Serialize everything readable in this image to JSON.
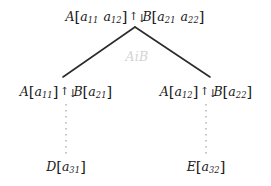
{
  "diagram": {
    "background_color": "#ffffff",
    "text_color": "#1a1a1a",
    "edge_color": "#2b2b2b",
    "dotted_color": "#b4b4b4",
    "edge_label_color": "#d3d3d3",
    "arrow_glyph_up": "↑",
    "arrow_glyph_down": "↓",
    "bracket_open": "[",
    "bracket_close": "]"
  },
  "nodes": {
    "root": {
      "left_symbol": "A",
      "left_entries": [
        "a",
        "a"
      ],
      "left_subscripts": [
        "11",
        "12"
      ],
      "relation": "↑↓",
      "right_symbol": "B",
      "right_entries": [
        "a",
        "a"
      ],
      "right_subscripts": [
        "21",
        "22"
      ],
      "plain_text": "A[a11 a12] ↑↓ B[a21 a22]"
    },
    "child_left": {
      "left_symbol": "A",
      "left_subscript": "11",
      "left_entry": "a",
      "relation": "↑↓",
      "right_symbol": "B",
      "right_entry": "a",
      "right_subscript": "21",
      "plain_text": "A[a11] ↑↓ B[a21]"
    },
    "child_right": {
      "left_symbol": "A",
      "left_entry": "a",
      "left_subscript": "12",
      "relation": "↑↓",
      "right_symbol": "B",
      "right_entry": "a",
      "right_subscript": "22",
      "plain_text": "A[a12] ↑↓ B[a22]"
    },
    "leaf_left": {
      "symbol": "D",
      "entry": "a",
      "subscript": "31",
      "plain_text": "D[a31]"
    },
    "leaf_right": {
      "symbol": "E",
      "entry": "a",
      "subscript": "32",
      "plain_text": "E[a32]"
    }
  },
  "edge_label": {
    "text": "AiB"
  }
}
